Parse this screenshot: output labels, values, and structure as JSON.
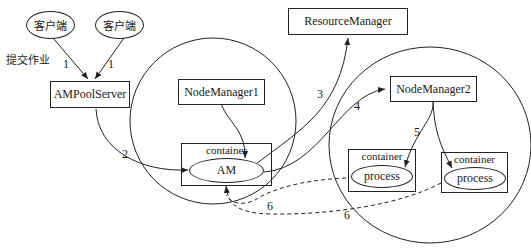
{
  "diagram": {
    "clients": [
      {
        "label": "客户端"
      },
      {
        "label": "客户端"
      }
    ],
    "submit_label": "提交作业",
    "ampool_server": "AMPoolServer",
    "resource_manager": "ResourceManager",
    "node_manager_1": "NodeManager1",
    "node_manager_2": "NodeManager2",
    "am_container": {
      "label": "container",
      "inner": "AM"
    },
    "process_containers": [
      {
        "label": "container",
        "inner": "process"
      },
      {
        "label": "container",
        "inner": "process"
      }
    ],
    "edge_labels": {
      "client1_to_ampool": "1",
      "client2_to_ampool": "1",
      "ampool_to_am": "2",
      "am_to_rm": "3",
      "am_to_nm2": "4",
      "nm2_to_container": "5",
      "process1_to_am": "6",
      "process2_to_am": "6"
    },
    "colors": {
      "stroke": "#222222",
      "background": "#ffffff"
    }
  }
}
